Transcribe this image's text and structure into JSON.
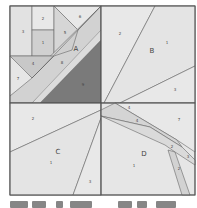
{
  "diagram": {
    "blocks": [
      {
        "id": "A",
        "label": "A",
        "pieces": [
          "1",
          "2",
          "3",
          "4",
          "5",
          "6",
          "7",
          "8",
          "9"
        ]
      },
      {
        "id": "B",
        "label": "B",
        "pieces": [
          "1",
          "2",
          "3"
        ]
      },
      {
        "id": "C",
        "label": "C",
        "pieces": [
          "1",
          "2",
          "3"
        ]
      },
      {
        "id": "D",
        "label": "D",
        "pieces": [
          "1",
          "2",
          "2",
          "3",
          "4",
          "4",
          "7"
        ]
      }
    ],
    "colors": {
      "light": "#e6e6e6",
      "mid": "#cfcfcf",
      "medium": "#b9b9b9",
      "dark": "#7a7a7a",
      "line": "#555555",
      "label": "#444444"
    }
  },
  "labels": {
    "A": "A",
    "B": "B",
    "C": "C",
    "D": "D",
    "a1": "1",
    "a2": "2",
    "a3": "3",
    "a4": "4",
    "a5": "5",
    "a6": "6",
    "a7": "7",
    "a8": "8",
    "a9": "9",
    "b1": "1",
    "b2": "2",
    "b3": "3",
    "c1": "1",
    "c2": "2",
    "c3": "3",
    "d1": "1",
    "d2a": "2",
    "d2b": "2",
    "d3": "3",
    "d4a": "4",
    "d4b": "4",
    "d7": "7"
  }
}
